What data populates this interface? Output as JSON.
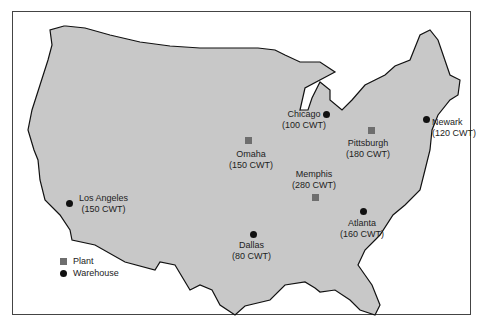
{
  "map": {
    "land_color": "#c8c8c8",
    "plant_color": "#6e6e6e",
    "warehouse_color": "#111111",
    "locations": [
      {
        "name": "Chicago",
        "amount": "(100 CWT)",
        "type": "warehouse"
      },
      {
        "name": "Newark",
        "amount": "(120 CWT)",
        "type": "warehouse"
      },
      {
        "name": "Omaha",
        "amount": "(150 CWT)",
        "type": "plant"
      },
      {
        "name": "Pittsburgh",
        "amount": "(180 CWT)",
        "type": "plant"
      },
      {
        "name": "Memphis",
        "amount": "(280 CWT)",
        "type": "plant"
      },
      {
        "name": "Los Angeles",
        "amount": "(150 CWT)",
        "type": "warehouse"
      },
      {
        "name": "Atlanta",
        "amount": "(160 CWT)",
        "type": "warehouse"
      },
      {
        "name": "Dallas",
        "amount": "(80 CWT)",
        "type": "warehouse"
      }
    ]
  },
  "legend": {
    "plant": "Plant",
    "warehouse": "Warehouse"
  }
}
